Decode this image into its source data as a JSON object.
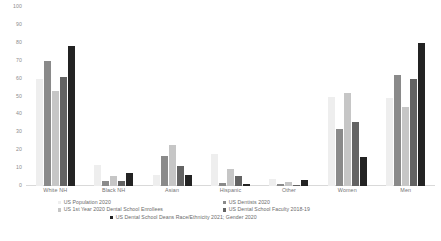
{
  "chart_data": {
    "type": "bar",
    "title": "",
    "xlabel": "",
    "ylabel": "",
    "ylim": [
      0,
      100
    ],
    "yticks": [
      0,
      10,
      20,
      30,
      40,
      50,
      60,
      70,
      80,
      90,
      100
    ],
    "grid": false,
    "legend_position": "bottom",
    "categories": [
      "White NH",
      "Black NH",
      "Asian",
      "Hispanic",
      "Other",
      "Women",
      "Men"
    ],
    "series": [
      {
        "name": "US Population 2020",
        "color": "#eeeeee",
        "values": [
          60,
          12,
          6,
          18,
          4,
          50,
          49
        ]
      },
      {
        "name": "US Dentists 2020",
        "color": "#8a8a8a",
        "values": [
          70,
          3,
          17,
          1.5,
          1,
          32,
          62
        ]
      },
      {
        "name": "US 1st Year 2020 Dental School Enrollees",
        "color": "#c6c6c6",
        "values": [
          53,
          5.5,
          23,
          9.5,
          2.5,
          52,
          44
        ]
      },
      {
        "name": "US Dental School Faculty 2018-19",
        "color": "#636363",
        "values": [
          61,
          3,
          11,
          5.5,
          0.5,
          36,
          60
        ]
      },
      {
        "name": "US Dental School Deans Race/Ethnicity 2021; Gender 2020",
        "color": "#232323",
        "values": [
          78,
          7.5,
          6,
          1,
          3.5,
          16,
          80
        ]
      }
    ]
  },
  "legend": {
    "row1_left": "US Population 2020",
    "row1_right": "US Dentists 2020",
    "row2_left": "US 1st Year 2020 Dental School Enrollees",
    "row2_right": "US Dental School Faculty 2018-19",
    "row3_center": "US Dental School Deans Race/Ethnicity 2021; Gender 2020"
  },
  "caption": {
    "text": ""
  }
}
